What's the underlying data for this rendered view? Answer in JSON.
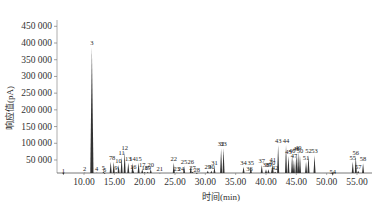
{
  "chart_data": {
    "type": "line",
    "title": "",
    "xlabel": "时间(min)",
    "ylabel": "响应值(pA)",
    "xlim": [
      5.5,
      58.5
    ],
    "ylim": [
      0,
      480000
    ],
    "grid": false,
    "legend": null,
    "x_ticks": [
      10.0,
      15.0,
      20.0,
      25.0,
      30.0,
      35.0,
      40.0,
      45.0,
      50.0,
      55.0
    ],
    "x_tick_labels": [
      "10.00",
      "15.00",
      "20.00",
      "25.00",
      "30.00",
      "35.00",
      "40.00",
      "45.00",
      "50.00",
      "55.00"
    ],
    "y_ticks": [
      50000,
      100000,
      150000,
      200000,
      250000,
      300000,
      350000,
      400000,
      450000
    ],
    "y_tick_labels": [
      "50 000",
      "100 000",
      "150 000",
      "200 000",
      "250 000",
      "300 000",
      "350 000",
      "400 000",
      "450 000"
    ],
    "peaks": [
      {
        "id": "1",
        "x": 6.6,
        "y": 5000
      },
      {
        "id": "2",
        "x": 10.1,
        "y": 12000
      },
      {
        "id": "3",
        "x": 11.3,
        "y": 388000
      },
      {
        "id": "4",
        "x": 12.1,
        "y": 12000
      },
      {
        "id": "5",
        "x": 13.2,
        "y": 15000
      },
      {
        "id": "6",
        "x": 13.4,
        "y": 8000
      },
      {
        "id": "7",
        "x": 14.4,
        "y": 45000
      },
      {
        "id": "8",
        "x": 14.9,
        "y": 45000
      },
      {
        "id": "9",
        "x": 15.3,
        "y": 14000
      },
      {
        "id": "10",
        "x": 15.7,
        "y": 35000
      },
      {
        "id": "11",
        "x": 16.2,
        "y": 60000
      },
      {
        "id": "12",
        "x": 16.7,
        "y": 75000
      },
      {
        "id": "13",
        "x": 17.3,
        "y": 42000
      },
      {
        "id": "14",
        "x": 18.0,
        "y": 42000
      },
      {
        "id": "15",
        "x": 19.0,
        "y": 42000
      },
      {
        "id": "16",
        "x": 18.1,
        "y": 18000
      },
      {
        "id": "17",
        "x": 19.6,
        "y": 22000
      },
      {
        "id": "18",
        "x": 20.0,
        "y": 14000
      },
      {
        "id": "19",
        "x": 20.5,
        "y": 15000
      },
      {
        "id": "20",
        "x": 21.0,
        "y": 22000
      },
      {
        "id": "21",
        "x": 22.5,
        "y": 10000
      },
      {
        "id": "22",
        "x": 24.8,
        "y": 42000
      },
      {
        "id": "23",
        "x": 25.3,
        "y": 12000
      },
      {
        "id": "24",
        "x": 26.0,
        "y": 12000
      },
      {
        "id": "25",
        "x": 26.5,
        "y": 32000
      },
      {
        "id": "26",
        "x": 27.6,
        "y": 32000
      },
      {
        "id": "27",
        "x": 27.9,
        "y": 15000
      },
      {
        "id": "28",
        "x": 28.6,
        "y": 8000
      },
      {
        "id": "29",
        "x": 30.4,
        "y": 18000
      },
      {
        "id": "30",
        "x": 31.0,
        "y": 18000
      },
      {
        "id": "31",
        "x": 31.5,
        "y": 28000
      },
      {
        "id": "32",
        "x": 32.6,
        "y": 85000
      },
      {
        "id": "33",
        "x": 33.0,
        "y": 85000
      },
      {
        "id": "34",
        "x": 36.3,
        "y": 30000
      },
      {
        "id": "35",
        "x": 37.5,
        "y": 30000
      },
      {
        "id": "36",
        "x": 37.3,
        "y": 10000
      },
      {
        "id": "37",
        "x": 39.3,
        "y": 35000
      },
      {
        "id": "38",
        "x": 40.0,
        "y": 22000
      },
      {
        "id": "39",
        "x": 40.4,
        "y": 22000
      },
      {
        "id": "40",
        "x": 41.0,
        "y": 28000
      },
      {
        "id": "41",
        "x": 41.1,
        "y": 38000
      },
      {
        "id": "42",
        "x": 41.5,
        "y": 15000
      },
      {
        "id": "43",
        "x": 42.0,
        "y": 95000
      },
      {
        "id": "44",
        "x": 43.3,
        "y": 95000
      },
      {
        "id": "45",
        "x": 43.7,
        "y": 62000
      },
      {
        "id": "46",
        "x": 44.3,
        "y": 65000
      },
      {
        "id": "47",
        "x": 44.6,
        "y": 50000
      },
      {
        "id": "48",
        "x": 45.0,
        "y": 70000
      },
      {
        "id": "49",
        "x": 45.3,
        "y": 74000
      },
      {
        "id": "50",
        "x": 45.6,
        "y": 65000
      },
      {
        "id": "51",
        "x": 46.6,
        "y": 45000
      },
      {
        "id": "52",
        "x": 47.0,
        "y": 65000
      },
      {
        "id": "53",
        "x": 48.0,
        "y": 65000
      },
      {
        "id": "54",
        "x": 51.0,
        "y": 3000
      },
      {
        "id": "55",
        "x": 54.3,
        "y": 45000
      },
      {
        "id": "56",
        "x": 54.8,
        "y": 60000
      },
      {
        "id": "57",
        "x": 55.2,
        "y": 18000
      },
      {
        "id": "58",
        "x": 56.0,
        "y": 40000
      }
    ]
  }
}
